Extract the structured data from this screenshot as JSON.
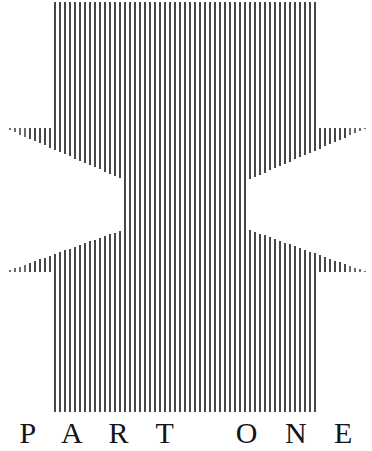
{
  "page": {
    "kind": "book-part-divider",
    "background_color": "#ffffff",
    "width": 372,
    "height": 451
  },
  "title": {
    "text": "P A R T   O N E",
    "plain_text": "PART ONE",
    "color": "#14141a",
    "letter_spacing_px": 10,
    "font_size_px": 30,
    "baseline_y": 447
  },
  "artwork": {
    "name": "vertical-stripe-bowtie-pattern",
    "description": "Op-art field of thin vertical lines. A solid central block of full-height lines is flanked by fanning outer lines. A bowtie / hourglass of white negative space cuts across the middle, and a diamond of stripes sits at the very center.",
    "line_color": "#474747",
    "line_color_soft": "#6b6b6b",
    "background_color": "#ffffff",
    "line_width_px": 2,
    "line_pitch_px": 5,
    "center_block": {
      "x_start": 55,
      "x_end": 318,
      "y_top": 2,
      "y_bottom": 412
    },
    "outer_fans": {
      "left_x_start": 5,
      "right_x_end": 367,
      "edge_y_top": 128,
      "edge_y_bottom": 272
    },
    "bowtie": {
      "center_x": 186,
      "center_y": 207,
      "left_vertex_x": 5,
      "right_vertex_x": 367,
      "upper_vertex_y": 128,
      "lower_vertex_y": 272
    },
    "center_diamond": {
      "center_x": 186,
      "center_y": 207,
      "half_width": 62,
      "half_height": 46
    }
  }
}
